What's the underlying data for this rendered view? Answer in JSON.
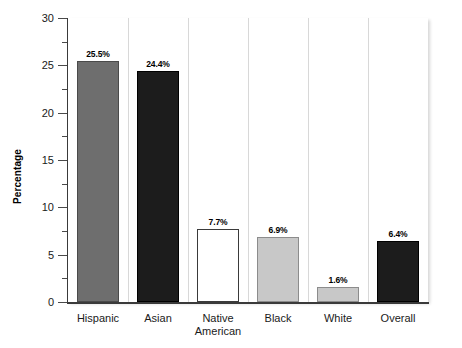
{
  "chart_data": {
    "type": "bar",
    "title": "",
    "xlabel": "",
    "ylabel": "Percentage",
    "ylim": [
      0,
      30
    ],
    "ytick_step": 5,
    "yminor_step": 2.5,
    "grid": false,
    "legend": null,
    "categories": [
      "Hispanic",
      "Asian",
      "Native\nAmerican",
      "Black",
      "White",
      "Overall"
    ],
    "values": [
      25.5,
      24.4,
      7.7,
      6.9,
      1.6,
      6.4
    ],
    "value_labels": [
      "25.5%",
      "24.4%",
      "7.7%",
      "6.9%",
      "1.6%",
      "6.4%"
    ],
    "bar_colors": [
      "#6e6e6e",
      "#1c1c1c",
      "#ffffff",
      "#c8c8c8",
      "#c8c8c8",
      "#1c1c1c"
    ],
    "bar_edge_colors": [
      "#4a4a4a",
      "#000000",
      "#3a3a3a",
      "#8c8c8c",
      "#8c8c8c",
      "#000000"
    ],
    "ytick_labels": [
      "0",
      "5",
      "10",
      "15",
      "20",
      "25",
      "30"
    ],
    "ytick_values": [
      0,
      5,
      10,
      15,
      20,
      25,
      30
    ]
  },
  "axis": {
    "y_title": "Percentage"
  }
}
